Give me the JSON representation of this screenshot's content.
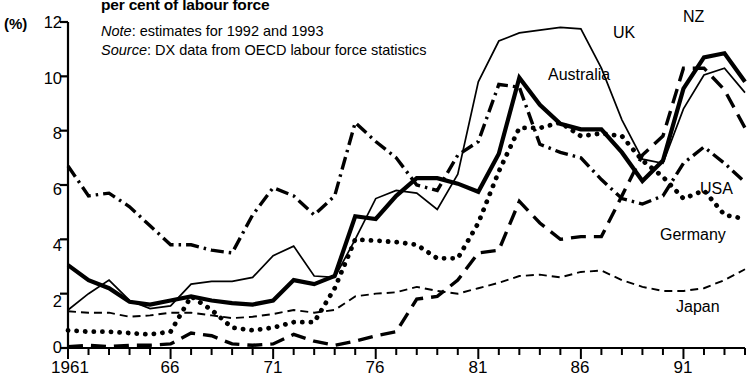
{
  "header": {
    "title": "per cent of labour force",
    "note_label": "Note",
    "note_text": ": estimates for 1992 and 1993",
    "source_label": "Source",
    "source_text": ": DX data from OECD labour force statistics"
  },
  "axes": {
    "y_unit": "(%)",
    "y_ticks": [
      "0",
      "2",
      "4",
      "6",
      "8",
      "10",
      "12"
    ],
    "x_ticks": [
      "1961",
      "66",
      "71",
      "76",
      "81",
      "86",
      "91"
    ]
  },
  "series_labels": {
    "uk": "UK",
    "nz": "NZ",
    "australia": "Australia",
    "usa": "USA",
    "germany": "Germany",
    "japan": "Japan"
  },
  "chart_data": {
    "type": "line",
    "title": "per cent of labour force",
    "xlabel": "",
    "ylabel": "(%)",
    "xlim": [
      1961,
      1994
    ],
    "ylim": [
      0,
      12
    ],
    "ytick_values": [
      0,
      2,
      4,
      6,
      8,
      10,
      12
    ],
    "xtick_values": [
      1961,
      1966,
      1971,
      1976,
      1981,
      1986,
      1991
    ],
    "grid": false,
    "legend": "inline-labels",
    "x": [
      1961,
      1962,
      1963,
      1964,
      1965,
      1966,
      1967,
      1968,
      1969,
      1970,
      1971,
      1972,
      1973,
      1974,
      1975,
      1976,
      1977,
      1978,
      1979,
      1980,
      1981,
      1982,
      1983,
      1984,
      1985,
      1986,
      1987,
      1988,
      1989,
      1990,
      1991,
      1992,
      1993,
      1994
    ],
    "series": [
      {
        "name": "USA",
        "style": "dash-dot",
        "values": [
          6.7,
          5.6,
          5.7,
          5.2,
          4.5,
          3.8,
          3.8,
          3.6,
          3.5,
          4.9,
          5.9,
          5.6,
          4.9,
          5.6,
          8.3,
          7.6,
          7.0,
          6.0,
          5.8,
          7.1,
          7.6,
          9.7,
          9.6,
          7.5,
          7.2,
          7.0,
          6.2,
          5.5,
          5.3,
          5.6,
          6.8,
          7.4,
          6.8,
          6.1
        ]
      },
      {
        "name": "Australia",
        "style": "thick-solid",
        "values": [
          3.05,
          2.5,
          2.2,
          1.7,
          1.6,
          1.75,
          1.9,
          1.75,
          1.65,
          1.6,
          1.75,
          2.5,
          2.35,
          2.65,
          4.85,
          4.75,
          5.6,
          6.25,
          6.25,
          6.05,
          5.75,
          7.15,
          9.95,
          8.95,
          8.25,
          8.05,
          8.05,
          7.2,
          6.15,
          6.9,
          9.55,
          10.7,
          10.85,
          9.8
        ]
      },
      {
        "name": "UK",
        "style": "thin-solid",
        "values": [
          1.4,
          2.0,
          2.5,
          1.75,
          1.45,
          1.55,
          2.35,
          2.45,
          2.45,
          2.6,
          3.4,
          3.75,
          2.65,
          2.6,
          4.0,
          5.5,
          5.8,
          5.7,
          5.1,
          6.4,
          9.8,
          11.3,
          11.6,
          11.7,
          11.8,
          11.75,
          10.3,
          8.4,
          6.95,
          6.8,
          8.8,
          10.05,
          10.3,
          9.4
        ]
      },
      {
        "name": "Germany",
        "style": "dotted",
        "values": [
          0.65,
          0.6,
          0.6,
          0.55,
          0.5,
          0.6,
          1.9,
          1.4,
          0.75,
          0.65,
          0.75,
          0.95,
          0.95,
          2.2,
          4.0,
          3.95,
          3.9,
          3.8,
          3.3,
          3.3,
          4.6,
          6.5,
          8.1,
          8.1,
          8.3,
          7.8,
          7.9,
          7.8,
          6.9,
          6.3,
          5.5,
          5.8,
          4.9,
          4.75
        ]
      },
      {
        "name": "Japan",
        "style": "fine-dashed",
        "values": [
          1.35,
          1.3,
          1.3,
          1.15,
          1.2,
          1.3,
          1.3,
          1.2,
          1.1,
          1.15,
          1.25,
          1.4,
          1.3,
          1.4,
          1.9,
          2.0,
          2.05,
          2.25,
          2.1,
          2.0,
          2.2,
          2.4,
          2.65,
          2.7,
          2.6,
          2.8,
          2.85,
          2.5,
          2.25,
          2.1,
          2.1,
          2.2,
          2.5,
          2.9
        ]
      },
      {
        "name": "NZ",
        "style": "long-dashed",
        "values": [
          0.05,
          0.1,
          0.05,
          0.1,
          0.1,
          0.15,
          0.55,
          0.45,
          0.15,
          0.1,
          0.15,
          0.5,
          0.25,
          0.1,
          0.25,
          0.45,
          0.6,
          1.8,
          1.9,
          2.5,
          3.5,
          3.6,
          5.4,
          4.6,
          4.0,
          4.1,
          4.1,
          5.6,
          7.1,
          7.8,
          10.3,
          10.3,
          9.5,
          8.1
        ]
      }
    ]
  }
}
